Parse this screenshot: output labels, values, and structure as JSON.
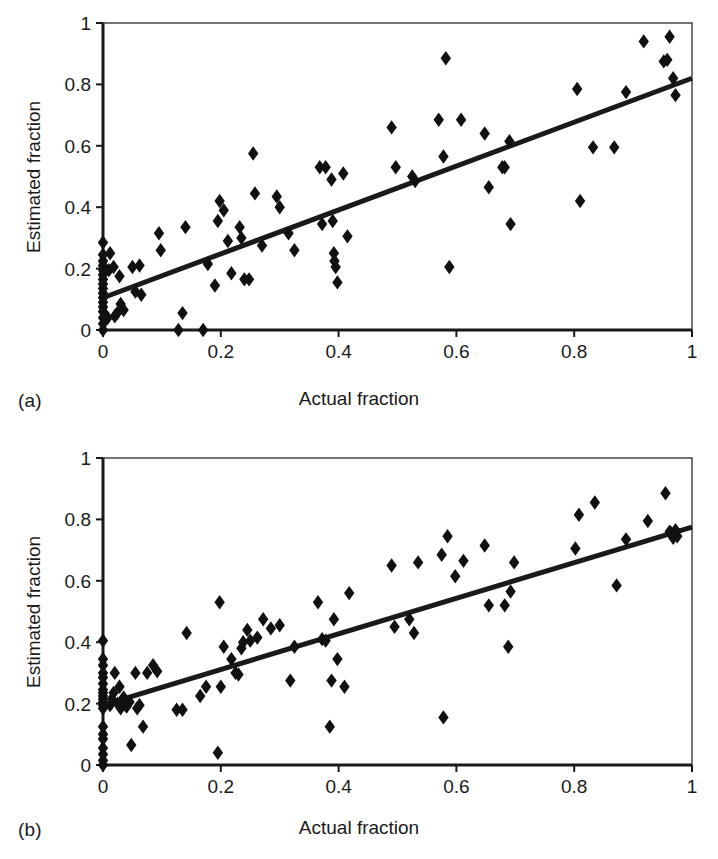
{
  "figure": {
    "background": "#ffffff",
    "ink_color": "#1a1a1a",
    "marker_shape": "diamond",
    "marker_color": "#111111"
  },
  "panels": [
    {
      "id": "a",
      "label": "(a)",
      "geometry": {
        "left": 103,
        "top": 23,
        "right": 692,
        "bottom": 330
      }
    },
    {
      "id": "b",
      "label": "(b)",
      "geometry": {
        "left": 103,
        "top": 29,
        "right": 692,
        "bottom": 336
      }
    }
  ],
  "chart_data": [
    {
      "type": "scatter",
      "panel": "a",
      "title": "",
      "xlabel": "Actual fraction",
      "ylabel": "Estimated fraction",
      "xlim": [
        0,
        1
      ],
      "ylim": [
        0,
        1
      ],
      "xticks": [
        0,
        0.2,
        0.4,
        0.6,
        0.8,
        1
      ],
      "yticks": [
        0,
        0.2,
        0.4,
        0.6,
        0.8,
        1
      ],
      "xticklabels": [
        "0",
        "0.2",
        "0.4",
        "0.6",
        "0.8",
        "1"
      ],
      "yticklabels": [
        "0",
        "0.2",
        "0.4",
        "0.6",
        "0.8",
        "1"
      ],
      "grid": false,
      "legend": null,
      "series": [
        {
          "name": "observations",
          "marker": "diamond",
          "points": [
            [
              0.0,
              0.0
            ],
            [
              0.0,
              0.02
            ],
            [
              0.0,
              0.04
            ],
            [
              0.0,
              0.06
            ],
            [
              0.0,
              0.075
            ],
            [
              0.0,
              0.09
            ],
            [
              0.0,
              0.105
            ],
            [
              0.0,
              0.12
            ],
            [
              0.0,
              0.135
            ],
            [
              0.0,
              0.15
            ],
            [
              0.0,
              0.165
            ],
            [
              0.0,
              0.18
            ],
            [
              0.0,
              0.195
            ],
            [
              0.0,
              0.21
            ],
            [
              0.0,
              0.225
            ],
            [
              0.0,
              0.245
            ],
            [
              0.0,
              0.285
            ],
            [
              0.008,
              0.04
            ],
            [
              0.01,
              0.195
            ],
            [
              0.012,
              0.25
            ],
            [
              0.018,
              0.205
            ],
            [
              0.02,
              0.045
            ],
            [
              0.024,
              0.055
            ],
            [
              0.028,
              0.175
            ],
            [
              0.03,
              0.085
            ],
            [
              0.035,
              0.065
            ],
            [
              0.05,
              0.205
            ],
            [
              0.055,
              0.125
            ],
            [
              0.062,
              0.21
            ],
            [
              0.065,
              0.115
            ],
            [
              0.095,
              0.315
            ],
            [
              0.098,
              0.26
            ],
            [
              0.128,
              0.0
            ],
            [
              0.135,
              0.055
            ],
            [
              0.14,
              0.335
            ],
            [
              0.17,
              0.0
            ],
            [
              0.178,
              0.215
            ],
            [
              0.19,
              0.145
            ],
            [
              0.195,
              0.355
            ],
            [
              0.198,
              0.42
            ],
            [
              0.205,
              0.39
            ],
            [
              0.212,
              0.29
            ],
            [
              0.218,
              0.185
            ],
            [
              0.232,
              0.335
            ],
            [
              0.235,
              0.3
            ],
            [
              0.24,
              0.165
            ],
            [
              0.248,
              0.165
            ],
            [
              0.255,
              0.575
            ],
            [
              0.258,
              0.445
            ],
            [
              0.27,
              0.275
            ],
            [
              0.295,
              0.435
            ],
            [
              0.3,
              0.4
            ],
            [
              0.315,
              0.315
            ],
            [
              0.325,
              0.26
            ],
            [
              0.368,
              0.53
            ],
            [
              0.372,
              0.345
            ],
            [
              0.378,
              0.53
            ],
            [
              0.388,
              0.49
            ],
            [
              0.39,
              0.355
            ],
            [
              0.392,
              0.25
            ],
            [
              0.393,
              0.225
            ],
            [
              0.395,
              0.205
            ],
            [
              0.398,
              0.155
            ],
            [
              0.408,
              0.51
            ],
            [
              0.415,
              0.305
            ],
            [
              0.49,
              0.66
            ],
            [
              0.497,
              0.53
            ],
            [
              0.525,
              0.5
            ],
            [
              0.53,
              0.485
            ],
            [
              0.57,
              0.685
            ],
            [
              0.578,
              0.565
            ],
            [
              0.582,
              0.885
            ],
            [
              0.588,
              0.205
            ],
            [
              0.608,
              0.685
            ],
            [
              0.648,
              0.64
            ],
            [
              0.655,
              0.465
            ],
            [
              0.678,
              0.53
            ],
            [
              0.682,
              0.53
            ],
            [
              0.69,
              0.615
            ],
            [
              0.692,
              0.345
            ],
            [
              0.805,
              0.785
            ],
            [
              0.81,
              0.42
            ],
            [
              0.832,
              0.595
            ],
            [
              0.868,
              0.595
            ],
            [
              0.888,
              0.775
            ],
            [
              0.918,
              0.94
            ],
            [
              0.952,
              0.875
            ],
            [
              0.958,
              0.88
            ],
            [
              0.962,
              0.955
            ],
            [
              0.968,
              0.82
            ],
            [
              0.972,
              0.765
            ]
          ]
        }
      ],
      "fit_line": {
        "name": "regression line",
        "x": [
          0.0,
          1.0
        ],
        "y": [
          0.105,
          0.82
        ],
        "slope": 0.715,
        "intercept": 0.105
      }
    },
    {
      "type": "scatter",
      "panel": "b",
      "title": "",
      "xlabel": "Actual fraction",
      "ylabel": "Estimated fraction",
      "xlim": [
        0,
        1
      ],
      "ylim": [
        0,
        1
      ],
      "xticks": [
        0,
        0.2,
        0.4,
        0.6,
        0.8,
        1
      ],
      "yticks": [
        0,
        0.2,
        0.4,
        0.6,
        0.8,
        1
      ],
      "xticklabels": [
        "0",
        "0.2",
        "0.4",
        "0.6",
        "0.8",
        "1"
      ],
      "yticklabels": [
        "0",
        "0.2",
        "0.4",
        "0.6",
        "0.8",
        "1"
      ],
      "grid": false,
      "legend": null,
      "series": [
        {
          "name": "observations",
          "marker": "diamond",
          "points": [
            [
              0.0,
              0.0
            ],
            [
              0.0,
              0.015
            ],
            [
              0.0,
              0.035
            ],
            [
              0.0,
              0.055
            ],
            [
              0.0,
              0.085
            ],
            [
              0.0,
              0.1
            ],
            [
              0.0,
              0.125
            ],
            [
              0.0,
              0.185
            ],
            [
              0.0,
              0.195
            ],
            [
              0.0,
              0.205
            ],
            [
              0.0,
              0.215
            ],
            [
              0.0,
              0.225
            ],
            [
              0.0,
              0.235
            ],
            [
              0.0,
              0.245
            ],
            [
              0.0,
              0.265
            ],
            [
              0.0,
              0.285
            ],
            [
              0.0,
              0.3
            ],
            [
              0.0,
              0.325
            ],
            [
              0.0,
              0.345
            ],
            [
              0.0,
              0.405
            ],
            [
              0.012,
              0.195
            ],
            [
              0.015,
              0.215
            ],
            [
              0.018,
              0.235
            ],
            [
              0.02,
              0.3
            ],
            [
              0.025,
              0.2
            ],
            [
              0.028,
              0.255
            ],
            [
              0.03,
              0.185
            ],
            [
              0.035,
              0.22
            ],
            [
              0.04,
              0.19
            ],
            [
              0.045,
              0.205
            ],
            [
              0.048,
              0.065
            ],
            [
              0.055,
              0.3
            ],
            [
              0.058,
              0.185
            ],
            [
              0.062,
              0.195
            ],
            [
              0.068,
              0.125
            ],
            [
              0.075,
              0.3
            ],
            [
              0.085,
              0.325
            ],
            [
              0.092,
              0.305
            ],
            [
              0.125,
              0.18
            ],
            [
              0.135,
              0.18
            ],
            [
              0.142,
              0.43
            ],
            [
              0.165,
              0.225
            ],
            [
              0.175,
              0.255
            ],
            [
              0.195,
              0.04
            ],
            [
              0.198,
              0.53
            ],
            [
              0.2,
              0.255
            ],
            [
              0.205,
              0.385
            ],
            [
              0.218,
              0.345
            ],
            [
              0.225,
              0.3
            ],
            [
              0.23,
              0.295
            ],
            [
              0.235,
              0.38
            ],
            [
              0.238,
              0.4
            ],
            [
              0.245,
              0.44
            ],
            [
              0.25,
              0.405
            ],
            [
              0.262,
              0.415
            ],
            [
              0.272,
              0.475
            ],
            [
              0.285,
              0.445
            ],
            [
              0.3,
              0.455
            ],
            [
              0.318,
              0.275
            ],
            [
              0.325,
              0.385
            ],
            [
              0.365,
              0.53
            ],
            [
              0.372,
              0.41
            ],
            [
              0.378,
              0.405
            ],
            [
              0.385,
              0.125
            ],
            [
              0.388,
              0.275
            ],
            [
              0.392,
              0.475
            ],
            [
              0.398,
              0.345
            ],
            [
              0.41,
              0.255
            ],
            [
              0.418,
              0.56
            ],
            [
              0.49,
              0.65
            ],
            [
              0.495,
              0.45
            ],
            [
              0.52,
              0.475
            ],
            [
              0.528,
              0.43
            ],
            [
              0.535,
              0.66
            ],
            [
              0.575,
              0.685
            ],
            [
              0.578,
              0.155
            ],
            [
              0.585,
              0.745
            ],
            [
              0.598,
              0.615
            ],
            [
              0.612,
              0.665
            ],
            [
              0.648,
              0.715
            ],
            [
              0.655,
              0.52
            ],
            [
              0.682,
              0.52
            ],
            [
              0.688,
              0.385
            ],
            [
              0.692,
              0.565
            ],
            [
              0.698,
              0.66
            ],
            [
              0.802,
              0.705
            ],
            [
              0.808,
              0.815
            ],
            [
              0.835,
              0.855
            ],
            [
              0.872,
              0.585
            ],
            [
              0.888,
              0.735
            ],
            [
              0.925,
              0.795
            ],
            [
              0.955,
              0.885
            ],
            [
              0.962,
              0.76
            ],
            [
              0.965,
              0.755
            ],
            [
              0.968,
              0.74
            ],
            [
              0.972,
              0.765
            ],
            [
              0.975,
              0.745
            ]
          ]
        }
      ],
      "fit_line": {
        "name": "regression line",
        "x": [
          0.0,
          1.0
        ],
        "y": [
          0.195,
          0.775
        ],
        "slope": 0.58,
        "intercept": 0.195
      }
    }
  ]
}
